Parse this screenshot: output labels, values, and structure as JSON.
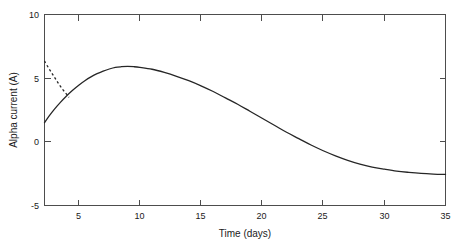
{
  "chart_data": {
    "type": "line",
    "title": "",
    "xlabel": "Time (days)",
    "ylabel": "Alpha current (A)",
    "xlim": [
      2.2,
      35.0
    ],
    "ylim": [
      -5,
      10
    ],
    "xticks": [
      5,
      10,
      15,
      20,
      25,
      30,
      35
    ],
    "xticklabels": [
      "5",
      "10",
      "15",
      "20",
      "25",
      "30",
      "35"
    ],
    "yticks": [
      -5,
      0,
      5,
      10
    ],
    "yticklabels": [
      "-5",
      "0",
      "5",
      "10"
    ],
    "grid": false,
    "legend": null,
    "box": true,
    "series": [
      {
        "name": "alpha-current-solid",
        "style": "solid",
        "color": "#262626",
        "x": [
          2.2,
          2.6,
          3.0,
          3.5,
          4.0,
          4.5,
          5.0,
          5.5,
          6.0,
          6.5,
          7.0,
          7.5,
          8.0,
          8.5,
          9.0,
          9.5,
          10.0,
          11.0,
          12.0,
          13.0,
          14.0,
          15.0,
          16.0,
          17.0,
          18.0,
          19.0,
          20.0,
          21.0,
          22.0,
          23.0,
          24.0,
          25.0,
          26.0,
          27.0,
          28.0,
          29.0,
          30.0,
          31.0,
          32.0,
          33.0,
          34.0,
          35.0
        ],
        "y": [
          1.5,
          2.05,
          2.55,
          3.1,
          3.6,
          4.05,
          4.45,
          4.8,
          5.1,
          5.35,
          5.55,
          5.72,
          5.85,
          5.9,
          5.92,
          5.9,
          5.85,
          5.7,
          5.45,
          5.15,
          4.8,
          4.4,
          3.95,
          3.45,
          2.95,
          2.4,
          1.85,
          1.3,
          0.75,
          0.25,
          -0.25,
          -0.7,
          -1.1,
          -1.45,
          -1.75,
          -1.98,
          -2.15,
          -2.3,
          -2.4,
          -2.48,
          -2.53,
          -2.56
        ]
      },
      {
        "name": "alpha-current-dashed",
        "style": "dashed",
        "color": "#262626",
        "x": [
          2.2,
          2.5,
          2.8,
          3.1,
          3.4,
          3.7,
          4.0,
          4.2
        ],
        "y": [
          6.35,
          5.85,
          5.4,
          4.95,
          4.5,
          4.1,
          3.75,
          3.5
        ]
      }
    ]
  },
  "axes": {
    "x_axis_title": "Time (days)",
    "y_axis_title": "Alpha current (A)"
  }
}
